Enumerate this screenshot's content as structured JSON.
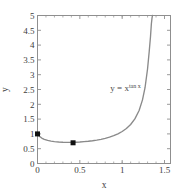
{
  "chart_data": {
    "type": "line",
    "title": "",
    "xlabel": "x",
    "ylabel": "y",
    "xlim": [
      0,
      1.5708
    ],
    "ylim": [
      0,
      5
    ],
    "grid": false,
    "legend": null,
    "xticks": [
      0,
      0.5,
      1,
      1.5
    ],
    "xticklabels": [
      "0",
      "0.5",
      "1",
      "1.5"
    ],
    "yticks": [
      0,
      0.5,
      1,
      1.5,
      2,
      2.5,
      3,
      3.5,
      4,
      4.5,
      5
    ],
    "yticklabels": [
      "0",
      "0.5",
      "1",
      "1.5",
      "2",
      "2.5",
      "3",
      "3.5",
      "4",
      "4.5",
      "5"
    ],
    "series": [
      {
        "name": "y = x^tan x",
        "color": "#8a8a8a",
        "x": [
          0.0,
          0.02,
          0.05,
          0.08,
          0.12,
          0.16,
          0.2,
          0.25,
          0.3,
          0.35,
          0.4,
          0.42,
          0.45,
          0.5,
          0.55,
          0.6,
          0.65,
          0.7,
          0.75,
          0.8,
          0.85,
          0.9,
          0.95,
          1.0,
          1.05,
          1.1,
          1.15,
          1.2,
          1.24,
          1.27,
          1.3,
          1.32,
          1.335,
          1.345,
          1.352,
          1.356,
          1.359
        ],
        "y": [
          1.0,
          0.925,
          0.859,
          0.818,
          0.781,
          0.757,
          0.74,
          0.725,
          0.717,
          0.714,
          0.715,
          0.716,
          0.719,
          0.726,
          0.737,
          0.751,
          0.769,
          0.791,
          0.818,
          0.851,
          0.891,
          0.941,
          1.003,
          1.081,
          1.183,
          1.318,
          1.507,
          1.791,
          2.15,
          2.56,
          3.2,
          3.8,
          4.3,
          4.72,
          4.9,
          4.97,
          5.0
        ]
      }
    ],
    "markers": [
      {
        "name": "endpoint-marker",
        "x": 0.0,
        "y": 1.0,
        "color": "#111111"
      },
      {
        "name": "minimum-marker",
        "x": 0.42,
        "y": 0.7,
        "color": "#111111"
      }
    ],
    "annotations": [
      {
        "name": "curve-equation",
        "base_text": "y = x",
        "sup_text": "tan x",
        "x": 0.86,
        "y": 2.45
      }
    ],
    "axis_color": "#8f8f8f",
    "background": "#ffffff"
  }
}
